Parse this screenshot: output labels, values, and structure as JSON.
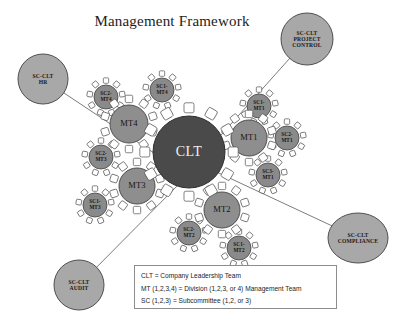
{
  "title": "Management Framework",
  "center": {
    "id": "clt",
    "label": "CLT",
    "cx": 189,
    "cy": 152,
    "r": 36,
    "chairs": 12,
    "color": "#4a4a4a"
  },
  "colors": {
    "center_fill": "#4a4a4a",
    "mt_fill": "#8e8e8e",
    "sc_fill": "#8a8a8a",
    "outer_fill": "#a8a8a8",
    "stroke": "#4f4f4f",
    "chair_fill": "#ffffff",
    "line": "#6d6d6d",
    "legend_border": "#8d8d8d",
    "background": "#ffffff"
  },
  "management_teams": [
    {
      "id": "mt4",
      "label": "MT4",
      "cx": 129,
      "cy": 124,
      "r": 19,
      "chairs": 10
    },
    {
      "id": "mt1",
      "label": "MT1",
      "cx": 249,
      "cy": 138,
      "r": 18,
      "chairs": 10
    },
    {
      "id": "mt3",
      "label": "MT3",
      "cx": 137,
      "cy": 186,
      "r": 18,
      "chairs": 10
    },
    {
      "id": "mt2",
      "label": "MT2",
      "cx": 222,
      "cy": 210,
      "r": 18,
      "chairs": 10
    }
  ],
  "subcommittees": [
    {
      "id": "sc2-mt4",
      "line1": "SC2-",
      "line2": "MT4",
      "cx": 106,
      "cy": 97,
      "r": 12,
      "chairs": 9
    },
    {
      "id": "sc1-mt4",
      "line1": "SC1-",
      "line2": "MT4",
      "cx": 162,
      "cy": 90,
      "r": 12,
      "chairs": 9
    },
    {
      "id": "sc1-mt1",
      "line1": "SC1-",
      "line2": "MT1",
      "cx": 259,
      "cy": 106,
      "r": 12,
      "chairs": 9
    },
    {
      "id": "sc2-mt1",
      "line1": "SC2-",
      "line2": "MT1",
      "cx": 287,
      "cy": 138,
      "r": 12,
      "chairs": 9
    },
    {
      "id": "sc3-mt1",
      "line1": "SC3-",
      "line2": "MT1",
      "cx": 268,
      "cy": 175,
      "r": 12,
      "chairs": 9
    },
    {
      "id": "sc2-mt3",
      "line1": "SC2-",
      "line2": "MT3",
      "cx": 101,
      "cy": 157,
      "r": 12,
      "chairs": 9
    },
    {
      "id": "sc1-mt3",
      "line1": "SC1-",
      "line2": "MT3",
      "cx": 95,
      "cy": 205,
      "r": 12,
      "chairs": 9
    },
    {
      "id": "sc2-mt2",
      "line1": "SC2-",
      "line2": "MT2",
      "cx": 189,
      "cy": 233,
      "r": 12,
      "chairs": 9
    },
    {
      "id": "sc1-mt2",
      "line1": "SC1-",
      "line2": "MT2",
      "cx": 239,
      "cy": 248,
      "r": 12,
      "chairs": 9
    }
  ],
  "outer_committees": [
    {
      "id": "sc-clt-hr",
      "lines": [
        "SC-CLT",
        "HR"
      ],
      "cx": 43,
      "cy": 79,
      "rx": 25,
      "ry": 25,
      "line_to": {
        "x": 172,
        "y": 165
      }
    },
    {
      "id": "sc-clt-project-control",
      "lines": [
        "SC-CLT",
        "PROJECT",
        "CONTROL"
      ],
      "cx": 307,
      "cy": 39,
      "rx": 26,
      "ry": 26,
      "line_to": {
        "x": 196,
        "y": 163
      }
    },
    {
      "id": "sc-clt-compliance",
      "lines": [
        "SC-CLT",
        "COMPLIANCE"
      ],
      "cx": 358,
      "cy": 238,
      "rx": 30,
      "ry": 25,
      "line_to": {
        "x": 208,
        "y": 168
      }
    },
    {
      "id": "sc-clt-audit",
      "lines": [
        "SC-CLT",
        "AUDIT"
      ],
      "cx": 79,
      "cy": 285,
      "rx": 25,
      "ry": 25,
      "line_to": {
        "x": 183,
        "y": 180
      }
    }
  ],
  "legend": {
    "rows": [
      "CLT = Company Leadership Team",
      "MT (1,2,3,4) = Division (1,2,3, or 4) Management Team",
      "SC (1,2,3) = Subcommittee (1,2, or 3)"
    ]
  }
}
